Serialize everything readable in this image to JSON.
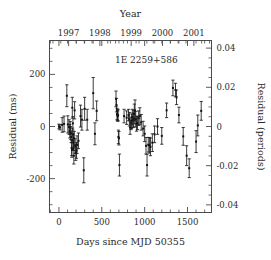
{
  "chart_data": {
    "type": "scatter",
    "title": "",
    "annotation": "1E 2259+586",
    "xlabel": "Days since MJD 50355",
    "ylabel": "Residual (ms)",
    "y2label": "Residual (periods)",
    "top_axis_label": "Year",
    "xlim": [
      -110,
      1780
    ],
    "ylim": [
      -330,
      330
    ],
    "y2lim": [
      -0.0469,
      0.0469
    ],
    "xticks": [
      0,
      500,
      1000,
      1500
    ],
    "xtick_labels": [
      "0",
      "500",
      "1000",
      "1500"
    ],
    "xticks_minor_step": 100,
    "yticks": [
      -200,
      0,
      200
    ],
    "ytick_labels": [
      "-200",
      "0",
      "200"
    ],
    "yticks_minor_step": 50,
    "y2ticks": [
      -0.04,
      -0.02,
      0,
      0.02,
      0.04
    ],
    "y2tick_labels": [
      "-0.04",
      "-0.02",
      "0",
      "0.02",
      "0.04"
    ],
    "y2ticks_minor_step": 0.005,
    "top_ticks_years": [
      1997,
      1998,
      1999,
      2000,
      2001
    ],
    "top_tick_labels": [
      "1997",
      "1998",
      "1999",
      "2000",
      "2001"
    ],
    "top_year_day_offsets": [
      113,
      478,
      843,
      1208,
      1574
    ],
    "top_minor_tick_days": 91.3,
    "grid": false,
    "legend": "none",
    "marker": "filled-square",
    "error_bars": "vertical-1sigma",
    "points": [
      {
        "x": 0,
        "y": 0,
        "yerr": 9
      },
      {
        "x": 12,
        "y": -3,
        "yerr": 10
      },
      {
        "x": 38,
        "y": 6,
        "yerr": 28
      },
      {
        "x": 60,
        "y": 10,
        "yerr": 30
      },
      {
        "x": 92,
        "y": 118,
        "yerr": 42
      },
      {
        "x": 104,
        "y": 8,
        "yerr": 33
      },
      {
        "x": 118,
        "y": -2,
        "yerr": 28
      },
      {
        "x": 126,
        "y": -18,
        "yerr": 26
      },
      {
        "x": 132,
        "y": -5,
        "yerr": 24
      },
      {
        "x": 138,
        "y": -25,
        "yerr": 25
      },
      {
        "x": 143,
        "y": -40,
        "yerr": 22
      },
      {
        "x": 148,
        "y": -82,
        "yerr": 30
      },
      {
        "x": 152,
        "y": -90,
        "yerr": 28
      },
      {
        "x": 156,
        "y": 72,
        "yerr": 40
      },
      {
        "x": 160,
        "y": -30,
        "yerr": 24
      },
      {
        "x": 163,
        "y": 12,
        "yerr": 26
      },
      {
        "x": 166,
        "y": -55,
        "yerr": 30
      },
      {
        "x": 170,
        "y": -62,
        "yerr": 30
      },
      {
        "x": 174,
        "y": -112,
        "yerr": 32
      },
      {
        "x": 178,
        "y": -45,
        "yerr": 26
      },
      {
        "x": 183,
        "y": 62,
        "yerr": 33
      },
      {
        "x": 190,
        "y": -75,
        "yerr": 28
      },
      {
        "x": 196,
        "y": -100,
        "yerr": 30
      },
      {
        "x": 205,
        "y": -92,
        "yerr": 30
      },
      {
        "x": 212,
        "y": -70,
        "yerr": 34
      },
      {
        "x": 228,
        "y": -55,
        "yerr": 30
      },
      {
        "x": 252,
        "y": 40,
        "yerr": 42
      },
      {
        "x": 268,
        "y": 26,
        "yerr": 40
      },
      {
        "x": 290,
        "y": -168,
        "yerr": 48
      },
      {
        "x": 300,
        "y": 68,
        "yerr": 44
      },
      {
        "x": 330,
        "y": 26,
        "yerr": 40
      },
      {
        "x": 400,
        "y": 128,
        "yerr": 60
      },
      {
        "x": 420,
        "y": -28,
        "yerr": 42
      },
      {
        "x": 440,
        "y": 60,
        "yerr": 38
      },
      {
        "x": 666,
        "y": 106,
        "yerr": 30
      },
      {
        "x": 672,
        "y": 82,
        "yerr": 26
      },
      {
        "x": 678,
        "y": 48,
        "yerr": 22
      },
      {
        "x": 682,
        "y": 44,
        "yerr": 20
      },
      {
        "x": 686,
        "y": 40,
        "yerr": 20
      },
      {
        "x": 690,
        "y": 44,
        "yerr": 22
      },
      {
        "x": 694,
        "y": -40,
        "yerr": 26
      },
      {
        "x": 700,
        "y": -45,
        "yerr": 26
      },
      {
        "x": 706,
        "y": -148,
        "yerr": 42
      },
      {
        "x": 760,
        "y": 40,
        "yerr": 26
      },
      {
        "x": 790,
        "y": 34,
        "yerr": 26
      },
      {
        "x": 812,
        "y": 44,
        "yerr": 22
      },
      {
        "x": 822,
        "y": 28,
        "yerr": 26
      },
      {
        "x": 830,
        "y": -4,
        "yerr": 26
      },
      {
        "x": 840,
        "y": 12,
        "yerr": 24
      },
      {
        "x": 848,
        "y": 20,
        "yerr": 28
      },
      {
        "x": 856,
        "y": 36,
        "yerr": 30
      },
      {
        "x": 864,
        "y": 24,
        "yerr": 28
      },
      {
        "x": 872,
        "y": 30,
        "yerr": 32
      },
      {
        "x": 880,
        "y": 48,
        "yerr": 38
      },
      {
        "x": 888,
        "y": 62,
        "yerr": 40
      },
      {
        "x": 896,
        "y": 28,
        "yerr": 30
      },
      {
        "x": 906,
        "y": 10,
        "yerr": 28
      },
      {
        "x": 916,
        "y": 14,
        "yerr": 26
      },
      {
        "x": 930,
        "y": 32,
        "yerr": 28
      },
      {
        "x": 944,
        "y": 40,
        "yerr": 32
      },
      {
        "x": 960,
        "y": 16,
        "yerr": 30
      },
      {
        "x": 982,
        "y": -8,
        "yerr": 28
      },
      {
        "x": 1000,
        "y": -28,
        "yerr": 30
      },
      {
        "x": 1016,
        "y": -74,
        "yerr": 32
      },
      {
        "x": 1028,
        "y": -148,
        "yerr": 42
      },
      {
        "x": 1042,
        "y": -70,
        "yerr": 28
      },
      {
        "x": 1056,
        "y": -72,
        "yerr": 30
      },
      {
        "x": 1068,
        "y": -78,
        "yerr": 34
      },
      {
        "x": 1090,
        "y": -62,
        "yerr": 34
      },
      {
        "x": 1116,
        "y": -30,
        "yerr": 32
      },
      {
        "x": 1150,
        "y": 0,
        "yerr": 30
      },
      {
        "x": 1200,
        "y": -36,
        "yerr": 32
      },
      {
        "x": 1256,
        "y": 62,
        "yerr": 28
      },
      {
        "x": 1330,
        "y": 148,
        "yerr": 30
      },
      {
        "x": 1360,
        "y": 140,
        "yerr": 26
      },
      {
        "x": 1372,
        "y": 112,
        "yerr": 28
      },
      {
        "x": 1400,
        "y": 44,
        "yerr": 30
      },
      {
        "x": 1450,
        "y": -38,
        "yerr": 34
      },
      {
        "x": 1490,
        "y": -112,
        "yerr": 38
      },
      {
        "x": 1520,
        "y": -160,
        "yerr": 36
      },
      {
        "x": 1600,
        "y": -58,
        "yerr": 42
      },
      {
        "x": 1620,
        "y": 4,
        "yerr": 40
      },
      {
        "x": 1660,
        "y": 60,
        "yerr": 36
      }
    ]
  },
  "colors": {
    "marker": "#111111",
    "axis": "#4a4a4a",
    "text": "#2b2b2b",
    "background": "#ffffff"
  }
}
